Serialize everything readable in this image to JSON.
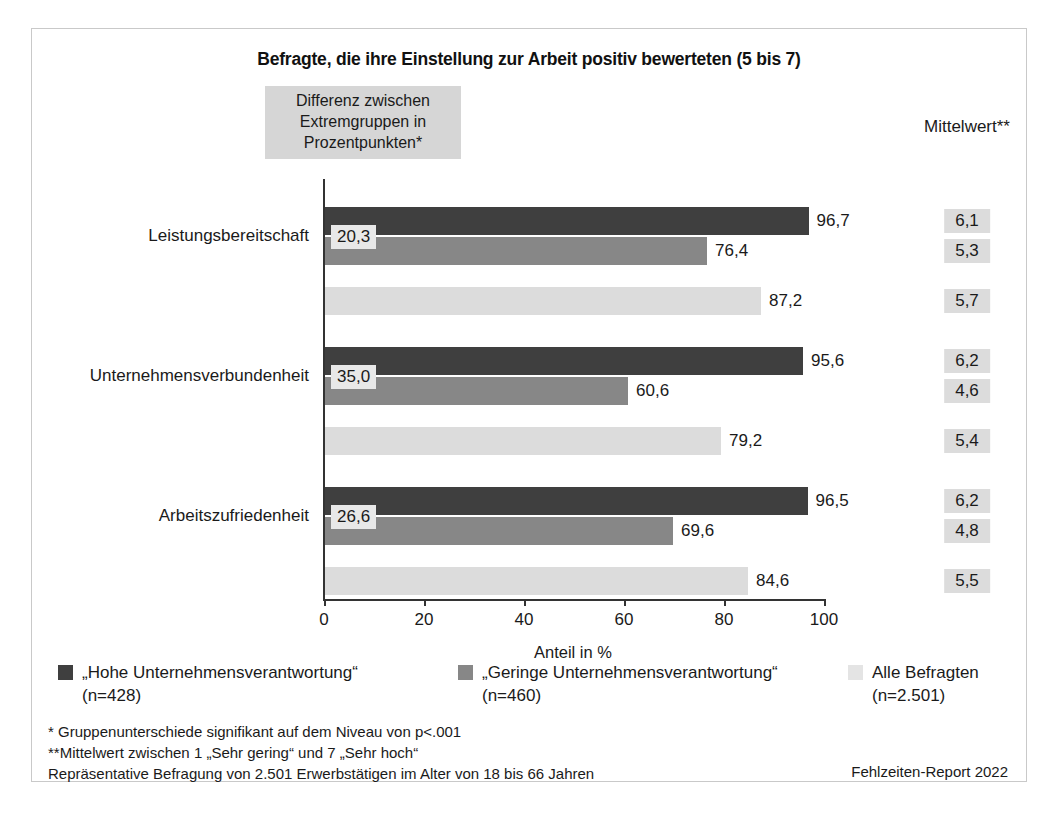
{
  "chart_data": {
    "type": "bar",
    "orientation": "horizontal",
    "title": "Befragte, die ihre Einstellung zur Arbeit positiv bewerteten (5 bis 7)",
    "xlabel": "Anteil in %",
    "ylabel": "",
    "xlim": [
      0,
      100
    ],
    "xticks": [
      0,
      20,
      40,
      60,
      80,
      100
    ],
    "xtick_labels": [
      "0",
      "20",
      "40",
      "60",
      "80",
      "100"
    ],
    "grid": false,
    "legend_position": "bottom",
    "categories": [
      "Leistungsbereitschaft",
      "Unternehmensverbundenheit",
      "Arbeitszufriedenheit"
    ],
    "series": [
      {
        "name": "„Hohe Unternehmensverantwortung“",
        "sublabel": "(n=428)",
        "color": "#3f3f3f",
        "values": [
          96.7,
          95.6,
          96.5
        ],
        "value_labels": [
          "96,7",
          "95,6",
          "96,5"
        ]
      },
      {
        "name": "„Geringe Unternehmensverantwortung“",
        "sublabel": "(n=460)",
        "color": "#878787",
        "values": [
          76.4,
          60.6,
          69.6
        ],
        "value_labels": [
          "76,4",
          "60,6",
          "69,6"
        ]
      },
      {
        "name": "Alle Befragten",
        "sublabel": "(n=2.501)",
        "color": "#dcdcdc",
        "values": [
          87.2,
          79.2,
          84.6
        ],
        "value_labels": [
          "87,2",
          "79,2",
          "84,6"
        ]
      }
    ],
    "annotations": {
      "difference_header": "Differenz zwischen Extremgruppen in Prozentpunkten*",
      "difference_values": [
        20.3,
        35.0,
        26.6
      ],
      "difference_labels": [
        "20,3",
        "35,0",
        "26,6"
      ],
      "means_header": "Mittelwert**",
      "means": [
        [
          6.1,
          5.3,
          5.7
        ],
        [
          6.2,
          4.6,
          5.4
        ],
        [
          6.2,
          4.8,
          5.5
        ]
      ],
      "mean_labels": [
        [
          "6,1",
          "5,3",
          "5,7"
        ],
        [
          "6,2",
          "4,6",
          "5,4"
        ],
        [
          "6,2",
          "4,8",
          "5,5"
        ]
      ]
    }
  },
  "header": {
    "title": "Befragte, die ihre Einstellung zur Arbeit positiv bewerteten (5 bis 7)"
  },
  "diff_box": {
    "line1": "Differenz zwischen",
    "line2": "Extremgruppen in",
    "line3": "Prozentpunkten*"
  },
  "means_column": {
    "header": "Mittelwert**"
  },
  "axis": {
    "x_title": "Anteil in %",
    "ticks": [
      "0",
      "20",
      "40",
      "60",
      "80",
      "100"
    ]
  },
  "categories": [
    {
      "label": "Leistungsbereitschaft"
    },
    {
      "label": "Unternehmensverbundenheit"
    },
    {
      "label": "Arbeitszufriedenheit"
    }
  ],
  "legend": [
    {
      "label": "„Hohe Unternehmensverantwortung“",
      "sublabel": "(n=428)",
      "color": "#3f3f3f"
    },
    {
      "label": "„Geringe Unternehmensverantwortung“",
      "sublabel": "(n=460)",
      "color": "#878787"
    },
    {
      "label": "Alle Befragten",
      "sublabel": "(n=2.501)",
      "color": "#e4e4e4"
    }
  ],
  "footnotes": [
    "*  Gruppenunterschiede signifikant auf dem Niveau von p<.001",
    "**Mittelwert zwischen 1 „Sehr gering“ und 7 „Sehr hoch“",
    "Repräsentative Befragung von 2.501 Erwerbstätigen im Alter von 18 bis 66 Jahren"
  ],
  "source": "Fehlzeiten-Report 2022"
}
